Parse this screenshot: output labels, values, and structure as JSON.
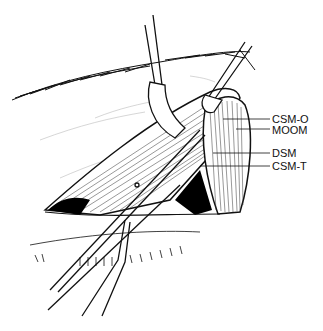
{
  "figure": {
    "type": "surgical-illustration",
    "labels": [
      {
        "id": "csm-o",
        "text": "CSM-O",
        "x": 272,
        "y": 123,
        "leader_from_x": 223,
        "leader_y": 119
      },
      {
        "id": "moom",
        "text": "MOOM",
        "x": 272,
        "y": 134,
        "leader_from_x": 236,
        "leader_y": 129
      },
      {
        "id": "dsm",
        "text": "DSM",
        "x": 272,
        "y": 157,
        "leader_from_x": 213,
        "leader_y": 153
      },
      {
        "id": "csm-t",
        "text": "CSM-T",
        "x": 272,
        "y": 170,
        "leader_from_x": 200,
        "leader_y": 166
      }
    ],
    "colors": {
      "ink": "#111111",
      "background": "#ffffff",
      "cavity": "#000000"
    }
  }
}
